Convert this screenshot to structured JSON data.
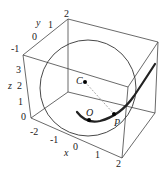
{
  "figure": {
    "type": "3d-plot",
    "axes": {
      "x": {
        "label": "x",
        "ticks": [
          "-2",
          "-1",
          "0",
          "1",
          "2"
        ]
      },
      "y": {
        "label": "y",
        "ticks": [
          "-1",
          "0",
          "1",
          "2"
        ]
      },
      "z": {
        "label": "z",
        "ticks": [
          "0",
          "1",
          "2",
          "3"
        ]
      }
    },
    "points": {
      "C": "C",
      "O": "O",
      "P": "P"
    },
    "colors": {
      "line": "#333333",
      "curve": "#222222",
      "dashed": "#aaaaaa"
    }
  }
}
